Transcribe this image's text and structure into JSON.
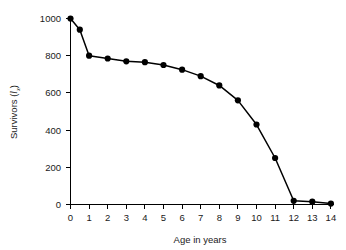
{
  "chart_data": {
    "type": "line",
    "title": "",
    "xlabel": "Age in years",
    "ylabel": "Survivors (lx)",
    "ylabel_main": "Survivors (",
    "ylabel_symbol": "l",
    "ylabel_subscript": "x",
    "ylabel_close": ")",
    "xlim": [
      0,
      14
    ],
    "ylim": [
      0,
      1000
    ],
    "grid": false,
    "legend": null,
    "marker": "filled-circle",
    "line_color": "#000000",
    "marker_color": "#000000",
    "x": [
      0,
      0.5,
      1,
      2,
      3,
      4,
      5,
      6,
      7,
      8,
      9,
      10,
      11,
      12,
      13,
      14
    ],
    "values": [
      1000,
      940,
      800,
      785,
      770,
      765,
      750,
      725,
      690,
      640,
      560,
      430,
      250,
      20,
      15,
      5
    ],
    "xticks": [
      0,
      1,
      2,
      3,
      4,
      5,
      6,
      7,
      8,
      9,
      10,
      11,
      12,
      13,
      14
    ],
    "xticklabels": [
      "0",
      "1",
      "2",
      "3",
      "4",
      "5",
      "6",
      "7",
      "8",
      "9",
      "10",
      "11",
      "12",
      "13",
      "14"
    ],
    "yticks": [
      0,
      200,
      400,
      600,
      800,
      1000
    ],
    "yticklabels": [
      "0",
      "200",
      "400",
      "600",
      "800",
      "1000"
    ]
  }
}
